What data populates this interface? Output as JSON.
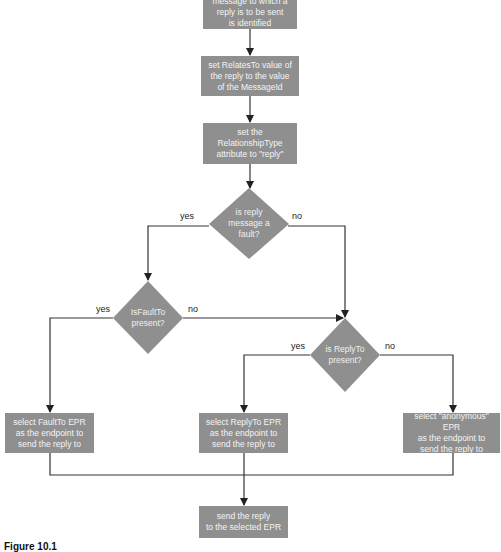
{
  "diagram": {
    "colors": {
      "node_fill": "#8f8f8f",
      "node_text": "#f4f4f4",
      "line": "#333333"
    },
    "nodes": {
      "start": {
        "type": "process",
        "label": "message to which a\nreply is to be sent\nis identified"
      },
      "relates_to": {
        "type": "process",
        "label": "set RelatesTo value of\nthe reply to the value\nof the MessageId"
      },
      "relationship_type": {
        "type": "process",
        "label": "set the\nRelationshipType\nattribute to \"reply\""
      },
      "is_fault": {
        "type": "decision",
        "label": "is reply\nmessage a\nfault?"
      },
      "fault_to_present": {
        "type": "decision",
        "label": "IsFaultTo\npresent?"
      },
      "reply_to_present": {
        "type": "decision",
        "label": "is ReplyTo\npresent?"
      },
      "select_fault_to": {
        "type": "process",
        "label": "select FaultTo EPR\nas the endpoint to\nsend the reply to"
      },
      "select_reply_to": {
        "type": "process",
        "label": "select ReplyTo EPR\nas the endpoint to\nsend the reply to"
      },
      "select_anonymous": {
        "type": "process",
        "label": "select \"anonymous\" EPR\nas the endpoint to\nsend the reply to"
      },
      "send_reply": {
        "type": "process",
        "label": "send the reply\nto the selected EPR"
      }
    },
    "edge_labels": {
      "is_fault_yes": "yes",
      "is_fault_no": "no",
      "fault_to_yes": "yes",
      "fault_to_no": "no",
      "reply_to_yes": "yes",
      "reply_to_no": "no"
    },
    "edges": [
      {
        "from": "start",
        "to": "relates_to"
      },
      {
        "from": "relates_to",
        "to": "relationship_type"
      },
      {
        "from": "relationship_type",
        "to": "is_fault"
      },
      {
        "from": "is_fault",
        "to": "fault_to_present",
        "label": "yes"
      },
      {
        "from": "is_fault",
        "to": "reply_to_present",
        "label": "no"
      },
      {
        "from": "fault_to_present",
        "to": "select_fault_to",
        "label": "yes"
      },
      {
        "from": "fault_to_present",
        "to": "reply_to_present",
        "label": "no"
      },
      {
        "from": "reply_to_present",
        "to": "select_reply_to",
        "label": "yes"
      },
      {
        "from": "reply_to_present",
        "to": "select_anonymous",
        "label": "no"
      },
      {
        "from": "select_fault_to",
        "to": "send_reply"
      },
      {
        "from": "select_reply_to",
        "to": "send_reply"
      },
      {
        "from": "select_anonymous",
        "to": "send_reply"
      }
    ]
  },
  "caption": "Figure 10.1"
}
